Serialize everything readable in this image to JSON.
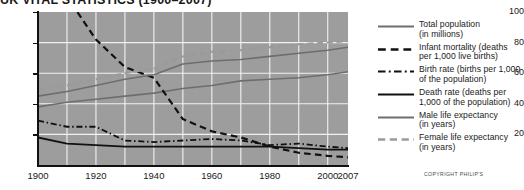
{
  "chart_data": {
    "type": "line",
    "title": "UK VITAL STATISTICS (1900–2007)",
    "xlabel": "",
    "ylabel": "",
    "xlim": [
      1900,
      2007
    ],
    "ylim": [
      0,
      100
    ],
    "grid": true,
    "legend_position": "right",
    "plot_background": "#9d9d9d",
    "gridline_color": "#f2f2f2",
    "x_ticks": [
      {
        "value": 1900,
        "label": "1900"
      },
      {
        "value": 1920,
        "label": "1920"
      },
      {
        "value": 1940,
        "label": "1940"
      },
      {
        "value": 1960,
        "label": "1960"
      },
      {
        "value": 1980,
        "label": "1980"
      },
      {
        "value": 2000,
        "label": "2000"
      },
      {
        "value": 2007,
        "label": "2007"
      }
    ],
    "x_gridlines": [
      1910,
      1920,
      1930,
      1940,
      1950,
      1960,
      1970,
      1980,
      1990,
      2000
    ],
    "y_ticks": [
      {
        "value": 100,
        "label": "100"
      },
      {
        "value": 80,
        "label": "80"
      },
      {
        "value": 60,
        "label": "60"
      },
      {
        "value": 40,
        "label": "40"
      },
      {
        "value": 20,
        "label": "20"
      }
    ],
    "y_gridlines": [
      20,
      40,
      60,
      80
    ],
    "series": [
      {
        "name": "Total population (in millions)",
        "legend_label": "Total population\n(in millions)",
        "style": "solid",
        "color": "#6e6e6e",
        "width": 1.6,
        "x": [
          1900,
          1910,
          1920,
          1930,
          1940,
          1950,
          1960,
          1970,
          1980,
          1990,
          2000,
          2007
        ],
        "values": [
          38,
          41,
          43,
          45,
          47,
          50,
          52,
          55,
          56,
          57,
          59,
          61
        ]
      },
      {
        "name": "Infant mortality (deaths per 1,000 live births)",
        "legend_label": "Infant mortality (deaths\nper 1,000 live births)",
        "style": "dashed",
        "color": "#111111",
        "width": 2.2,
        "x": [
          1900,
          1910,
          1920,
          1930,
          1940,
          1950,
          1960,
          1970,
          1980,
          1990,
          2000,
          2007
        ],
        "values": [
          142,
          110,
          82,
          64,
          57,
          30,
          22,
          18,
          12,
          8,
          6,
          5
        ]
      },
      {
        "name": "Birth rate (births per 1,000 of the population)",
        "legend_label": "Birth rate (births per 1,000\nof the population)",
        "style": "dashdot",
        "color": "#111111",
        "width": 1.8,
        "x": [
          1900,
          1910,
          1920,
          1930,
          1940,
          1950,
          1960,
          1970,
          1980,
          1990,
          2000,
          2007
        ],
        "values": [
          29,
          25,
          25,
          16,
          15,
          16,
          17,
          16,
          13,
          14,
          12,
          11
        ]
      },
      {
        "name": "Death rate (deaths per 1,000 of the population)",
        "legend_label": "Death rate (deaths per\n1,000 of the population)",
        "style": "solid",
        "color": "#111111",
        "width": 1.8,
        "x": [
          1900,
          1910,
          1920,
          1930,
          1940,
          1950,
          1960,
          1970,
          1980,
          1990,
          2000,
          2007
        ],
        "values": [
          18,
          14,
          13,
          12,
          12,
          12,
          12,
          12,
          12,
          11,
          10,
          10
        ]
      },
      {
        "name": "Male life expectancy (in years)",
        "legend_label": "Male life expectancy\n(in years)",
        "style": "solid",
        "color": "#6e6e6e",
        "width": 1.6,
        "x": [
          1900,
          1910,
          1920,
          1930,
          1940,
          1950,
          1960,
          1970,
          1980,
          1990,
          2000,
          2007
        ],
        "values": [
          45,
          48,
          52,
          56,
          59,
          66,
          68,
          69,
          71,
          73,
          75,
          77
        ]
      },
      {
        "name": "Female life expectancy (in years)",
        "legend_label": "Female life expectancy\n(in years)",
        "style": "dashed",
        "color": "#9a9a9a",
        "width": 2.0,
        "x": [
          1900,
          1910,
          1920,
          1930,
          1940,
          1950,
          1960,
          1970,
          1980,
          1990,
          2000,
          2007
        ],
        "values": [
          49,
          52,
          56,
          60,
          63,
          71,
          74,
          75,
          77,
          79,
          80,
          81
        ]
      }
    ]
  },
  "copyright": "COPYRIGHT PHILIP'S"
}
